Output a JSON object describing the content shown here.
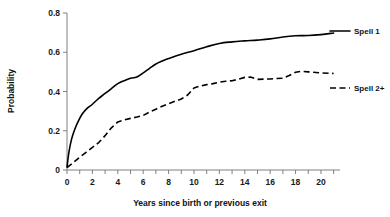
{
  "chart_data": {
    "type": "line",
    "title": "",
    "xlabel": "Years since birth or previous exit",
    "ylabel": "Probability",
    "xlim": [
      0,
      21.5
    ],
    "ylim": [
      0,
      0.8
    ],
    "grid": false,
    "legend_position": "right",
    "xticks": [
      0,
      1,
      2,
      3,
      4,
      5,
      6,
      7,
      8,
      9,
      10,
      11,
      12,
      13,
      14,
      15,
      16,
      17,
      18,
      19,
      20,
      21
    ],
    "xtick_labels": [
      "0",
      "",
      "2",
      "",
      "4",
      "",
      "6",
      "",
      "8",
      "",
      "10",
      "",
      "12",
      "",
      "14",
      "",
      "16",
      "",
      "18",
      "",
      "20",
      ""
    ],
    "yticks": [
      0,
      0.2,
      0.4,
      0.6,
      0.8
    ],
    "ytick_labels": [
      "0",
      "0.2",
      "0.4",
      "0.6",
      "0.8"
    ],
    "series": [
      {
        "name": "Spell 1",
        "style": "solid",
        "color": "#000000",
        "x": [
          0,
          0.15,
          0.35,
          0.6,
          0.9,
          1.2,
          1.6,
          2.0,
          2.5,
          3.0,
          3.5,
          4.0,
          4.5,
          5.0,
          5.5,
          6.0,
          6.5,
          7.0,
          7.5,
          8.0,
          9.0,
          10.0,
          11.0,
          12.0,
          13.0,
          14.0,
          15.0,
          16.0,
          17.0,
          18.0,
          19.0,
          20.0,
          21.0
        ],
        "y": [
          0.015,
          0.09,
          0.155,
          0.205,
          0.25,
          0.285,
          0.315,
          0.335,
          0.365,
          0.39,
          0.415,
          0.44,
          0.455,
          0.468,
          0.474,
          0.495,
          0.518,
          0.54,
          0.555,
          0.568,
          0.59,
          0.608,
          0.628,
          0.645,
          0.653,
          0.658,
          0.662,
          0.668,
          0.678,
          0.684,
          0.685,
          0.69,
          0.698
        ]
      },
      {
        "name": "Spell 2+",
        "style": "dashed",
        "color": "#000000",
        "x": [
          0,
          0.5,
          1.0,
          1.5,
          2.0,
          2.5,
          3.0,
          3.5,
          4.0,
          4.5,
          5.0,
          5.5,
          6.0,
          6.5,
          7.0,
          7.5,
          8.0,
          8.5,
          9.0,
          9.5,
          10.0,
          10.5,
          11.0,
          11.5,
          12.0,
          12.5,
          13.0,
          13.5,
          14.0,
          14.5,
          15.0,
          16.0,
          17.0,
          17.5,
          18.0,
          18.5,
          19.0,
          20.0,
          21.0
        ],
        "y": [
          0.012,
          0.038,
          0.065,
          0.09,
          0.115,
          0.14,
          0.175,
          0.215,
          0.245,
          0.255,
          0.263,
          0.27,
          0.278,
          0.295,
          0.31,
          0.325,
          0.338,
          0.35,
          0.362,
          0.382,
          0.418,
          0.428,
          0.435,
          0.44,
          0.448,
          0.452,
          0.455,
          0.462,
          0.472,
          0.473,
          0.462,
          0.464,
          0.468,
          0.482,
          0.498,
          0.503,
          0.5,
          0.495,
          0.492
        ]
      }
    ],
    "legend_entries": [
      {
        "label": "Spell 1",
        "style": "solid"
      },
      {
        "label": "Spell 2+",
        "style": "dashed"
      }
    ]
  }
}
